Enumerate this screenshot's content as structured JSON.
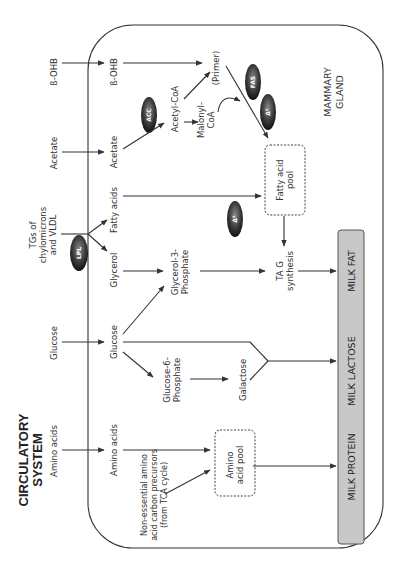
{
  "circulatory": {
    "title_line1": "CIRCULATORY",
    "title_line2": "SYSTEM",
    "inputs": {
      "bohb": "ß-OHB",
      "acetate": "Acetate",
      "tgs_line1": "TGs  of",
      "tgs_line2": "chylomicrons",
      "tgs_line3": "and VLDL",
      "glucose": "Glucose",
      "amino_acids": "Amino acids"
    }
  },
  "mammary": {
    "title_line1": "MAMMARY",
    "title_line2": "GLAND",
    "nodes": {
      "bohb": "ß-OHB",
      "acetate": "Acetate",
      "fatty_acids": "Fatty  acids",
      "glycerol": "Glycerol",
      "glucose": "Glucose",
      "amino_acids": "Amino acids",
      "acetyl_coa": "Acetyl-CoA",
      "malonyl_coa_line1": "Malonyl-",
      "malonyl_coa_line2": "CoA",
      "primer": "(Primer)",
      "glycerol3p_line1": "Glycerol-3-",
      "glycerol3p_line2": "Phosphate",
      "glucose6p_line1": "Glucose-6-",
      "glucose6p_line2": "Phosphate",
      "galactose": "Galactose",
      "fatty_acid_pool_line1": "Fatty  acid",
      "fatty_acid_pool_line2": "pool",
      "tag_line1": "TA G",
      "tag_line2": "synthesis",
      "amino_pool_line1": "Amino",
      "amino_pool_line2": "acid  pool",
      "neaa_line1": "Non-essential   amino",
      "neaa_line2": "acid  carbon  precursors",
      "neaa_line3": "(from  TCA  cycle)"
    },
    "enzymes": {
      "acc": "ACC",
      "fas": "FAS",
      "delta9_top": "Δ⁹",
      "delta9_mid": "Δ⁹",
      "lpl": "LPL"
    }
  },
  "products": {
    "milk_fat": "MILK FAT",
    "milk_lactose": "MILK LACTOSE",
    "milk_protein": "MILK PROTEIN"
  },
  "colors": {
    "product_bar": "#c8c8c8",
    "enzyme_dark": "#2a2a2a",
    "line": "#333333"
  }
}
